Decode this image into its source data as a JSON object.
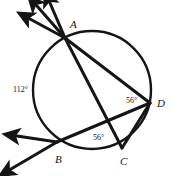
{
  "figure": {
    "kind": "circle-geometry-diagram",
    "background_color": "#ffffff",
    "stroke_color": "#151515",
    "width": 173,
    "height": 176,
    "circle": {
      "cx": 92,
      "cy": 90,
      "r": 59
    },
    "points": {
      "A": {
        "x": 65,
        "y": 38
      },
      "B": {
        "x": 57,
        "y": 142
      },
      "C": {
        "x": 122,
        "y": 148
      },
      "D": {
        "x": 150,
        "y": 103
      }
    },
    "vertex_labels": [
      {
        "text": "A",
        "x": 70,
        "y": 28
      },
      {
        "text": "B",
        "x": 55,
        "y": 163
      },
      {
        "text": "C",
        "x": 120,
        "y": 165
      },
      {
        "text": "D",
        "x": 157,
        "y": 107
      }
    ],
    "angle_labels": [
      {
        "text": "112°",
        "x": 13,
        "y": 92
      },
      {
        "text": "56°",
        "x": 126,
        "y": 103
      },
      {
        "text": "56°",
        "x": 93,
        "y": 140
      }
    ],
    "chords": [
      {
        "name": "chord-A-D",
        "from": "A",
        "to": "D"
      },
      {
        "name": "chord-C-D",
        "from": "C",
        "to": "D"
      }
    ],
    "secants": [
      {
        "name": "secant-A-C",
        "from": "A",
        "to": "C"
      },
      {
        "name": "secant-D-B",
        "from": "D",
        "to": "B"
      }
    ],
    "rays": [
      {
        "name": "ray-from-A-upper-left",
        "x1": 65,
        "y1": 38,
        "x2": 28,
        "y2": 18,
        "arrow": true
      },
      {
        "name": "ray-from-A-up",
        "x1": 65,
        "y1": 38,
        "x2": 36,
        "y2": 4,
        "arrow": true
      },
      {
        "name": "ray-from-A-up-right",
        "x1": 65,
        "y1": 38,
        "x2": 49,
        "y2": 1,
        "arrow": true
      },
      {
        "name": "ray-from-B-left",
        "x1": 57,
        "y1": 142,
        "x2": 15,
        "y2": 136,
        "arrow": true
      },
      {
        "name": "ray-from-B-lower-left",
        "x1": 57,
        "y1": 142,
        "x2": 9,
        "y2": 170,
        "arrow": true
      }
    ]
  }
}
